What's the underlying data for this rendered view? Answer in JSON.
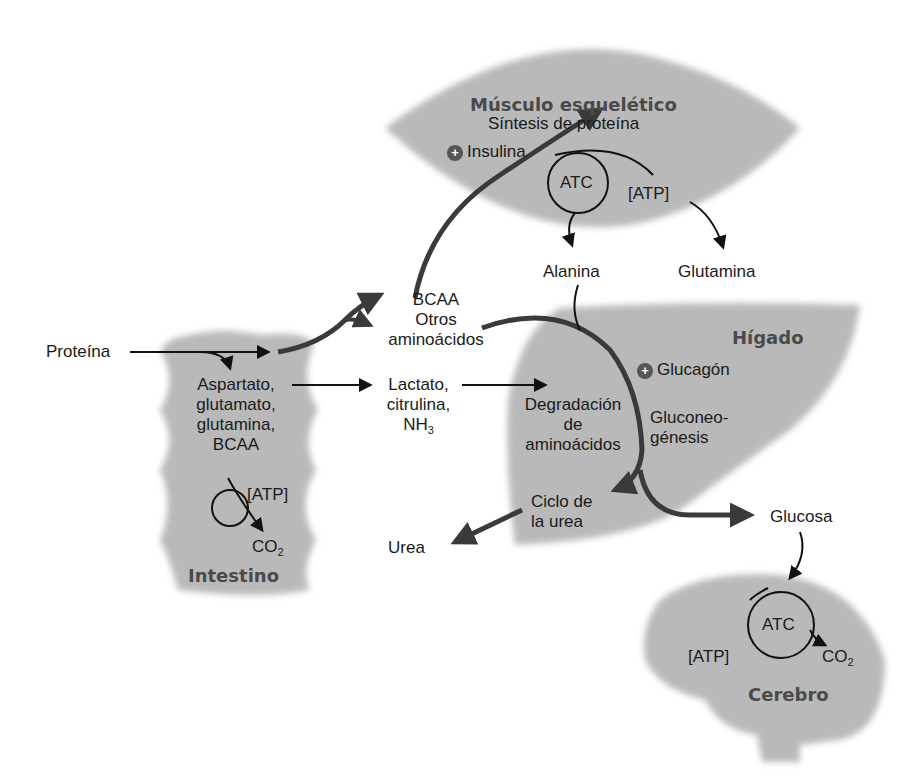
{
  "organs": {
    "muscle": {
      "title": "Músculo esquelético",
      "process": "Síntesis de proteína",
      "hormone": "Insulina",
      "cycle": "ATC",
      "atp": "[ATP]",
      "outputs": [
        "Alanina",
        "Glutamina"
      ]
    },
    "intestine": {
      "title": "Intestino",
      "input": "Proteína",
      "amino_acids": [
        "Aspartato,",
        "glutamato,",
        "glutamina,",
        "BCAA"
      ],
      "atp": "[ATP]",
      "co2": "CO",
      "co2_sub": "2"
    },
    "liver": {
      "title": "Hígado",
      "hormone": "Glucagón",
      "degradation": [
        "Degradación",
        "de",
        "aminoácidos"
      ],
      "gluconeogenesis": [
        "Gluconeo-",
        "génesis"
      ],
      "urea_cycle": [
        "Ciclo de",
        "la urea"
      ]
    },
    "brain": {
      "title": "Cerebro",
      "cycle": "ATC",
      "atp": "[ATP]",
      "co2": "CO",
      "co2_sub": "2"
    }
  },
  "intermediates": {
    "bcaa_group": [
      "BCAA",
      "Otros",
      "aminoácidos"
    ],
    "lactate_group": [
      "Lactato,",
      "citrulina,",
      "NH"
    ],
    "nh3_sub": "3",
    "urea": "Urea",
    "glucose": "Glucosa"
  },
  "plus_symbol": "+",
  "colors": {
    "organ_fill": "#b9b9b9",
    "organ_edge": "#9a9a9a",
    "arrow_dark": "#3a3a3a",
    "text": "#1a1a1a",
    "organ_title": "#4a4a4a"
  }
}
